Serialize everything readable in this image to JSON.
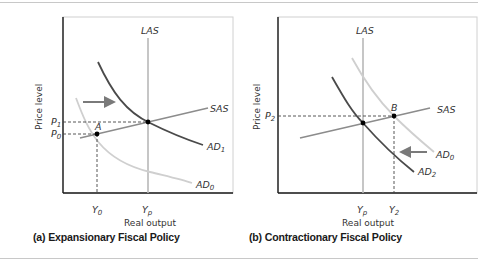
{
  "panels": [
    {
      "id": "a",
      "caption": "(a)  Expansionary Fiscal Policy",
      "y_axis_label": "Price level",
      "x_axis_label": "Real output",
      "curves": {
        "las": "LAS",
        "sas": "SAS",
        "ad_new": {
          "base": "AD",
          "sub": "1"
        },
        "ad_old": {
          "base": "AD",
          "sub": "0"
        }
      },
      "y_ticks": [
        {
          "base": "P",
          "sub": "1"
        },
        {
          "base": "P",
          "sub": "0"
        }
      ],
      "x_ticks": [
        {
          "base": "Y",
          "sub": "0"
        },
        {
          "base": "Y",
          "sub": "p"
        }
      ],
      "points": [
        "A"
      ],
      "shift_direction": "right"
    },
    {
      "id": "b",
      "caption": "(b)  Contractionary Fiscal Policy",
      "y_axis_label": "Price level",
      "x_axis_label": "Real output",
      "curves": {
        "las": "LAS",
        "sas": "SAS",
        "ad_old": {
          "base": "AD",
          "sub": "0"
        },
        "ad_new": {
          "base": "AD",
          "sub": "2"
        }
      },
      "y_ticks": [
        {
          "base": "P",
          "sub": "2"
        }
      ],
      "x_ticks": [
        {
          "base": "Y",
          "sub": "p"
        },
        {
          "base": "Y",
          "sub": "2"
        }
      ],
      "points": [
        "B"
      ],
      "shift_direction": "left"
    }
  ],
  "colors": {
    "axis": "#1a1a1a",
    "las": "#b8b8b8",
    "sas": "#8c8c8c",
    "ad_dark": "#4a4a4a",
    "ad_light": "#cfcfcf",
    "arrow": "#7a7a7a",
    "dash": "#444444"
  }
}
